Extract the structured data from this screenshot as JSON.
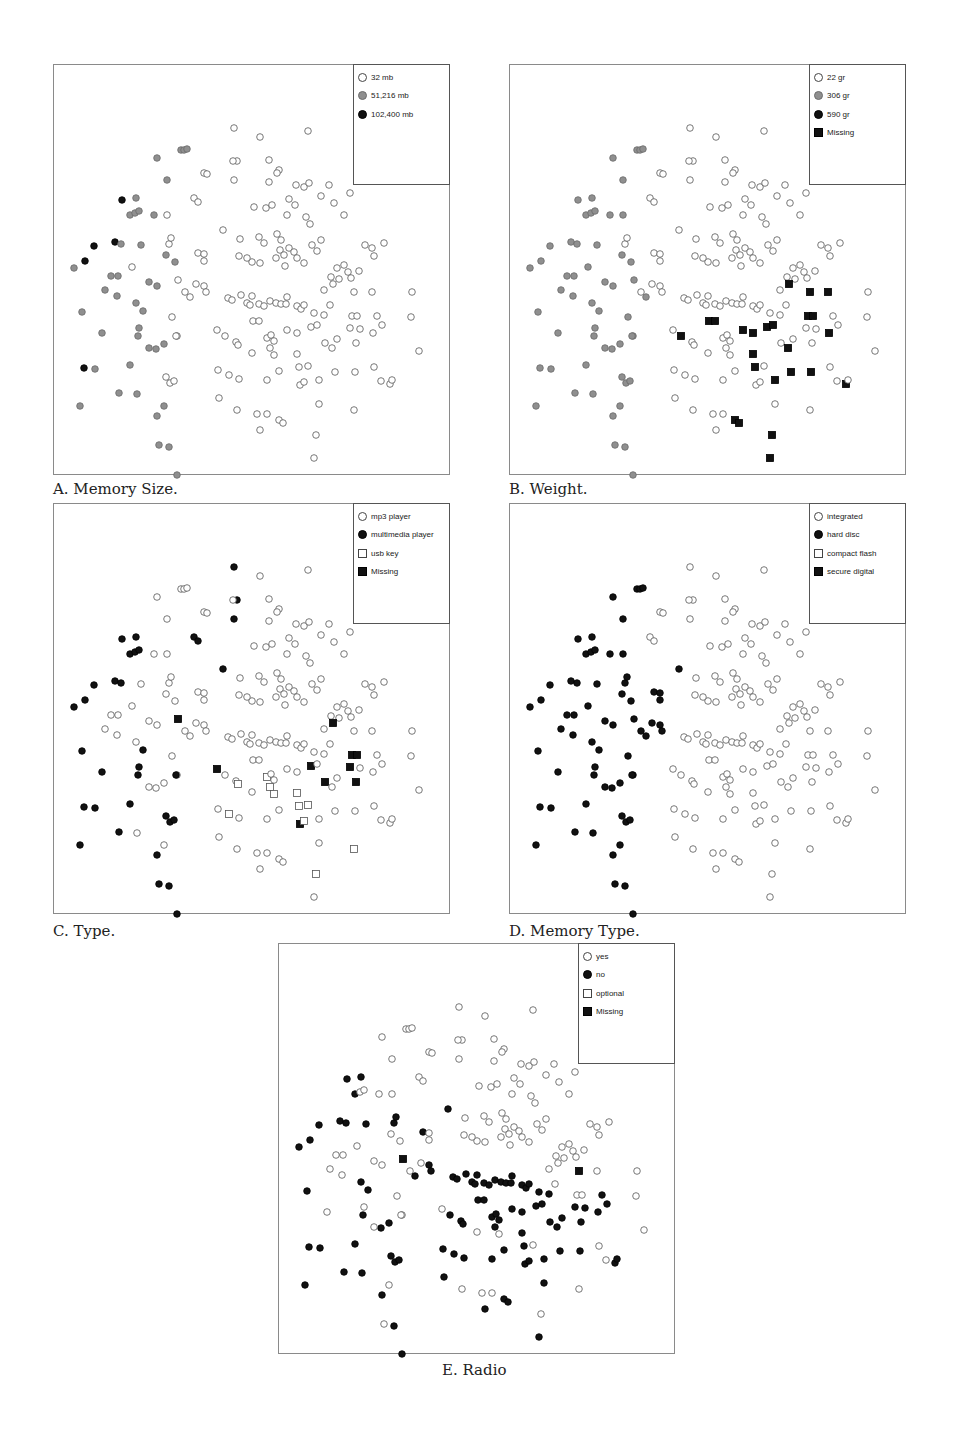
{
  "chart_data": [
    {
      "type": "scatter",
      "id": "A",
      "title": "A. Memory Size.",
      "xlabel": "",
      "ylabel": "",
      "grid": false,
      "legend_position": "top-right",
      "legend": [
        {
          "label": "32 mb",
          "marker": "circle",
          "fill": "hollow"
        },
        {
          "label": "51,216 mb",
          "marker": "circle",
          "fill": "gray"
        },
        {
          "label": "102,400 mb",
          "marker": "circle",
          "fill": "black"
        }
      ]
    },
    {
      "type": "scatter",
      "id": "B",
      "title": "B. Weight.",
      "xlabel": "",
      "ylabel": "",
      "grid": false,
      "legend_position": "top-right",
      "legend": [
        {
          "label": "22 gr",
          "marker": "circle",
          "fill": "hollow"
        },
        {
          "label": "306 gr",
          "marker": "circle",
          "fill": "gray"
        },
        {
          "label": "590 gr",
          "marker": "circle",
          "fill": "black"
        },
        {
          "label": "Missing",
          "marker": "square",
          "fill": "black"
        }
      ]
    },
    {
      "type": "scatter",
      "id": "C",
      "title": "C. Type.",
      "xlabel": "",
      "ylabel": "",
      "grid": false,
      "legend_position": "top-right",
      "legend": [
        {
          "label": "mp3 player",
          "marker": "circle",
          "fill": "hollow"
        },
        {
          "label": "multimedia player",
          "marker": "circle",
          "fill": "black"
        },
        {
          "label": "usb key",
          "marker": "square",
          "fill": "hollow"
        },
        {
          "label": "Missing",
          "marker": "square",
          "fill": "black"
        }
      ]
    },
    {
      "type": "scatter",
      "id": "D",
      "title": "D. Memory Type.",
      "xlabel": "",
      "ylabel": "",
      "grid": false,
      "legend_position": "top-right",
      "legend": [
        {
          "label": "integrated",
          "marker": "circle",
          "fill": "hollow"
        },
        {
          "label": "hard disc",
          "marker": "circle",
          "fill": "black"
        },
        {
          "label": "compact flash",
          "marker": "square",
          "fill": "hollow"
        },
        {
          "label": "secure digital",
          "marker": "square",
          "fill": "black"
        }
      ]
    },
    {
      "type": "scatter",
      "id": "E",
      "title": "E. Radio",
      "xlabel": "",
      "ylabel": "",
      "grid": false,
      "legend_position": "top-right",
      "legend": [
        {
          "label": "yes",
          "marker": "circle",
          "fill": "hollow"
        },
        {
          "label": "no",
          "marker": "circle",
          "fill": "black"
        },
        {
          "label": "optional",
          "marker": "square",
          "fill": "hollow"
        },
        {
          "label": "Missing",
          "marker": "square",
          "fill": "black"
        }
      ]
    }
  ],
  "points_note": "Shared 2D projection layout; coordinates in px relative to panel top-left (panel ~397x411). Each point lists category index for panels [A,B,C,D,E].",
  "points": [
    [
      180,
      63,
      0,
      0,
      1,
      0,
      0
    ],
    [
      206,
      72,
      0,
      0,
      0,
      0,
      0
    ],
    [
      254,
      66,
      0,
      0,
      0,
      0,
      0
    ],
    [
      127,
      85,
      1,
      1,
      0,
      1,
      0
    ],
    [
      130,
      85,
      1,
      1,
      0,
      1,
      0
    ],
    [
      133,
      84,
      1,
      1,
      0,
      1,
      0
    ],
    [
      103,
      93,
      1,
      1,
      0,
      1,
      0
    ],
    [
      183,
      96,
      0,
      0,
      1,
      0,
      0
    ],
    [
      179,
      96,
      0,
      0,
      0,
      0,
      0
    ],
    [
      150,
      108,
      0,
      0,
      0,
      0,
      0
    ],
    [
      153,
      109,
      0,
      0,
      0,
      0,
      0
    ],
    [
      180,
      115,
      0,
      0,
      1,
      0,
      0
    ],
    [
      215,
      95,
      0,
      0,
      0,
      0,
      0
    ],
    [
      225,
      105,
      0,
      0,
      0,
      0,
      0
    ],
    [
      113,
      115,
      1,
      1,
      0,
      1,
      0
    ],
    [
      68,
      135,
      2,
      1,
      1,
      1,
      1
    ],
    [
      82,
      133,
      1,
      1,
      1,
      1,
      1
    ],
    [
      76,
      150,
      1,
      1,
      1,
      1,
      1
    ],
    [
      81,
      148,
      1,
      1,
      1,
      1,
      0
    ],
    [
      85,
      146,
      1,
      1,
      1,
      1,
      0
    ],
    [
      100,
      150,
      1,
      1,
      0,
      1,
      0
    ],
    [
      113,
      150,
      0,
      1,
      0,
      1,
      0
    ],
    [
      140,
      133,
      0,
      0,
      1,
      0,
      0
    ],
    [
      144,
      137,
      0,
      0,
      1,
      0,
      0
    ],
    [
      215,
      117,
      0,
      0,
      0,
      0,
      0
    ],
    [
      223,
      108,
      0,
      0,
      0,
      0,
      0
    ],
    [
      242,
      120,
      0,
      0,
      0,
      0,
      0
    ],
    [
      250,
      122,
      0,
      0,
      0,
      0,
      0
    ],
    [
      255,
      118,
      0,
      0,
      0,
      0,
      0
    ],
    [
      275,
      120,
      0,
      0,
      0,
      0,
      0
    ],
    [
      235,
      134,
      0,
      0,
      0,
      0,
      0
    ],
    [
      241,
      140,
      0,
      0,
      0,
      0,
      0
    ],
    [
      267,
      131,
      0,
      0,
      0,
      0,
      0
    ],
    [
      296,
      128,
      0,
      0,
      0,
      0,
      0
    ],
    [
      280,
      138,
      0,
      0,
      0,
      0,
      0
    ],
    [
      290,
      150,
      0,
      0,
      0,
      0,
      0
    ],
    [
      200,
      142,
      0,
      0,
      0,
      0,
      0
    ],
    [
      212,
      143,
      0,
      0,
      0,
      0,
      0
    ],
    [
      218,
      140,
      0,
      0,
      0,
      0,
      0
    ],
    [
      233,
      150,
      0,
      0,
      0,
      0,
      0
    ],
    [
      252,
      152,
      0,
      0,
      0,
      0,
      0
    ],
    [
      256,
      159,
      0,
      0,
      0,
      0,
      0
    ],
    [
      61,
      177,
      2,
      1,
      1,
      1,
      1
    ],
    [
      67,
      179,
      1,
      1,
      1,
      1,
      1
    ],
    [
      40,
      181,
      2,
      1,
      1,
      1,
      1
    ],
    [
      87,
      180,
      1,
      1,
      0,
      1,
      1
    ],
    [
      115,
      179,
      0,
      0,
      0,
      1,
      1
    ],
    [
      117,
      173,
      0,
      0,
      0,
      1,
      1
    ],
    [
      169,
      165,
      0,
      0,
      1,
      1,
      1
    ],
    [
      186,
      174,
      0,
      0,
      0,
      0,
      0
    ],
    [
      205,
      172,
      0,
      0,
      0,
      0,
      0
    ],
    [
      210,
      178,
      0,
      0,
      0,
      0,
      0
    ],
    [
      223,
      169,
      0,
      0,
      0,
      0,
      0
    ],
    [
      227,
      175,
      0,
      0,
      0,
      0,
      0
    ],
    [
      226,
      185,
      0,
      0,
      0,
      0,
      0
    ],
    [
      235,
      183,
      0,
      0,
      0,
      0,
      0
    ],
    [
      240,
      187,
      0,
      0,
      0,
      0,
      0
    ],
    [
      222,
      193,
      0,
      0,
      0,
      0,
      0
    ],
    [
      230,
      190,
      0,
      0,
      0,
      0,
      0
    ],
    [
      243,
      193,
      0,
      0,
      0,
      0,
      0
    ],
    [
      231,
      201,
      0,
      0,
      0,
      0,
      0
    ],
    [
      206,
      198,
      0,
      0,
      0,
      0,
      0
    ],
    [
      198,
      197,
      0,
      0,
      0,
      0,
      0
    ],
    [
      185,
      191,
      0,
      0,
      0,
      0,
      0
    ],
    [
      193,
      193,
      0,
      0,
      0,
      0,
      0
    ],
    [
      258,
      180,
      0,
      0,
      0,
      0,
      0
    ],
    [
      267,
      175,
      0,
      0,
      0,
      0,
      0
    ],
    [
      263,
      186,
      0,
      0,
      0,
      0,
      0
    ],
    [
      250,
      198,
      0,
      0,
      0,
      0,
      0
    ],
    [
      20,
      203,
      1,
      1,
      1,
      1,
      1
    ],
    [
      31,
      196,
      2,
      1,
      1,
      1,
      1
    ],
    [
      78,
      202,
      0,
      1,
      0,
      1,
      0
    ],
    [
      112,
      190,
      1,
      1,
      0,
      1,
      0
    ],
    [
      121,
      197,
      1,
      1,
      0,
      1,
      0
    ],
    [
      144,
      188,
      0,
      0,
      0,
      1,
      1
    ],
    [
      150,
      189,
      0,
      0,
      0,
      1,
      0
    ],
    [
      150,
      196,
      0,
      0,
      0,
      1,
      0
    ],
    [
      283,
      203,
      0,
      0,
      0,
      0,
      0
    ],
    [
      290,
      200,
      0,
      0,
      0,
      0,
      0
    ],
    [
      294,
      207,
      0,
      0,
      0,
      0,
      0
    ],
    [
      277,
      212,
      0,
      0,
      0,
      0,
      0
    ],
    [
      285,
      214,
      0,
      0,
      0,
      0,
      0
    ],
    [
      297,
      213,
      0,
      0,
      0,
      0,
      0
    ],
    [
      305,
      206,
      0,
      0,
      0,
      0,
      0
    ],
    [
      318,
      183,
      0,
      0,
      0,
      0,
      0
    ],
    [
      311,
      180,
      0,
      0,
      0,
      0,
      0
    ],
    [
      320,
      191,
      0,
      0,
      0,
      0,
      0
    ],
    [
      330,
      178,
      0,
      0,
      0,
      0,
      0
    ],
    [
      57,
      211,
      1,
      1,
      0,
      1,
      0
    ],
    [
      64,
      211,
      1,
      1,
      0,
      1,
      0
    ],
    [
      51,
      225,
      1,
      1,
      0,
      1,
      0
    ],
    [
      63,
      231,
      1,
      1,
      0,
      1,
      0
    ],
    [
      95,
      217,
      1,
      1,
      0,
      1,
      0
    ],
    [
      103,
      221,
      1,
      1,
      0,
      1,
      0
    ],
    [
      124,
      215,
      0,
      1,
      3,
      1,
      3
    ],
    [
      131,
      227,
      0,
      0,
      0,
      1,
      0
    ],
    [
      136,
      232,
      0,
      1,
      0,
      1,
      1
    ],
    [
      142,
      219,
      0,
      0,
      0,
      1,
      0
    ],
    [
      150,
      221,
      0,
      0,
      0,
      1,
      1
    ],
    [
      152,
      227,
      0,
      0,
      0,
      1,
      1
    ],
    [
      174,
      233,
      0,
      0,
      0,
      0,
      1
    ],
    [
      178,
      235,
      0,
      0,
      0,
      0,
      1
    ],
    [
      187,
      230,
      0,
      0,
      0,
      0,
      1
    ],
    [
      193,
      238,
      0,
      0,
      0,
      0,
      1
    ],
    [
      198,
      231,
      0,
      0,
      0,
      0,
      1
    ],
    [
      196,
      240,
      0,
      0,
      0,
      0,
      1
    ],
    [
      205,
      239,
      0,
      0,
      0,
      0,
      1
    ],
    [
      210,
      241,
      0,
      0,
      0,
      0,
      1
    ],
    [
      216,
      236,
      0,
      0,
      0,
      0,
      1
    ],
    [
      222,
      238,
      0,
      0,
      0,
      0,
      1
    ],
    [
      227,
      239,
      0,
      0,
      0,
      0,
      1
    ],
    [
      232,
      239,
      0,
      0,
      0,
      0,
      1
    ],
    [
      233,
      232,
      0,
      0,
      0,
      0,
      1
    ],
    [
      243,
      241,
      0,
      0,
      0,
      0,
      1
    ],
    [
      247,
      244,
      0,
      0,
      0,
      0,
      1
    ],
    [
      250,
      240,
      0,
      0,
      0,
      0,
      1
    ],
    [
      260,
      248,
      0,
      0,
      0,
      0,
      1
    ],
    [
      270,
      250,
      0,
      0,
      0,
      0,
      1
    ],
    [
      276,
      240,
      0,
      0,
      0,
      0,
      0
    ],
    [
      270,
      225,
      0,
      0,
      0,
      0,
      0
    ],
    [
      279,
      219,
      0,
      3,
      3,
      0,
      0
    ],
    [
      300,
      227,
      0,
      3,
      0,
      0,
      3
    ],
    [
      318,
      227,
      0,
      3,
      0,
      0,
      0
    ],
    [
      28,
      247,
      1,
      1,
      1,
      1,
      1
    ],
    [
      48,
      268,
      1,
      1,
      1,
      1,
      0
    ],
    [
      82,
      238,
      1,
      1,
      0,
      1,
      1
    ],
    [
      89,
      246,
      1,
      1,
      1,
      1,
      1
    ],
    [
      84,
      271,
      1,
      1,
      1,
      1,
      1
    ],
    [
      85,
      263,
      1,
      1,
      1,
      1,
      0
    ],
    [
      118,
      252,
      0,
      1,
      0,
      1,
      0
    ],
    [
      102,
      284,
      1,
      1,
      0,
      1,
      1
    ],
    [
      123,
      271,
      0,
      1,
      0,
      1,
      0
    ],
    [
      95,
      283,
      1,
      1,
      0,
      1,
      0
    ],
    [
      110,
      279,
      1,
      1,
      0,
      1,
      1
    ],
    [
      122,
      271,
      0,
      1,
      1,
      1,
      0
    ],
    [
      163,
      265,
      0,
      0,
      3,
      0,
      0
    ],
    [
      171,
      271,
      0,
      3,
      0,
      0,
      1
    ],
    [
      182,
      277,
      0,
      0,
      0,
      0,
      1
    ],
    [
      199,
      256,
      0,
      3,
      0,
      0,
      1
    ],
    [
      205,
      256,
      0,
      3,
      0,
      0,
      1
    ],
    [
      184,
      280,
      0,
      0,
      2,
      0,
      1
    ],
    [
      198,
      288,
      0,
      0,
      0,
      0,
      0
    ],
    [
      213,
      273,
      0,
      0,
      2,
      0,
      1
    ],
    [
      216,
      283,
      0,
      0,
      2,
      0,
      1
    ],
    [
      220,
      290,
      0,
      0,
      2,
      0,
      0
    ],
    [
      217,
      270,
      0,
      0,
      0,
      0,
      1
    ],
    [
      220,
      276,
      0,
      0,
      0,
      0,
      1
    ],
    [
      233,
      265,
      0,
      3,
      0,
      0,
      1
    ],
    [
      243,
      268,
      0,
      3,
      0,
      0,
      1
    ],
    [
      243,
      289,
      0,
      3,
      2,
      0,
      1
    ],
    [
      245,
      302,
      0,
      3,
      2,
      0,
      1
    ],
    [
      254,
      301,
      0,
      0,
      2,
      0,
      0
    ],
    [
      257,
      262,
      0,
      3,
      3,
      0,
      1
    ],
    [
      263,
      260,
      0,
      3,
      0,
      0,
      1
    ],
    [
      271,
      278,
      0,
      0,
      3,
      0,
      1
    ],
    [
      278,
      283,
      0,
      3,
      0,
      0,
      1
    ],
    [
      283,
      274,
      0,
      0,
      0,
      0,
      1
    ],
    [
      296,
      263,
      0,
      0,
      3,
      0,
      1
    ],
    [
      302,
      278,
      0,
      0,
      3,
      0,
      1
    ],
    [
      298,
      251,
      0,
      3,
      3,
      0,
      0
    ],
    [
      303,
      251,
      0,
      3,
      3,
      0,
      0
    ],
    [
      319,
      268,
      0,
      3,
      0,
      0,
      1
    ],
    [
      323,
      251,
      0,
      0,
      0,
      0,
      1
    ],
    [
      328,
      260,
      0,
      0,
      0,
      0,
      1
    ],
    [
      306,
      264,
      0,
      0,
      0,
      0,
      1
    ],
    [
      357,
      252,
      0,
      0,
      0,
      0,
      0
    ],
    [
      365,
      286,
      0,
      0,
      0,
      0,
      0
    ],
    [
      358,
      227,
      0,
      0,
      0,
      0,
      0
    ],
    [
      30,
      303,
      2,
      1,
      1,
      1,
      1
    ],
    [
      41,
      304,
      1,
      1,
      1,
      1,
      1
    ],
    [
      76,
      300,
      1,
      1,
      1,
      1,
      1
    ],
    [
      112,
      312,
      0,
      1,
      1,
      1,
      1
    ],
    [
      116,
      318,
      0,
      1,
      1,
      1,
      1
    ],
    [
      120,
      316,
      0,
      1,
      1,
      1,
      1
    ],
    [
      65,
      328,
      1,
      1,
      1,
      1,
      1
    ],
    [
      83,
      329,
      1,
      1,
      0,
      1,
      1
    ],
    [
      164,
      305,
      0,
      0,
      0,
      0,
      1
    ],
    [
      175,
      310,
      0,
      0,
      2,
      0,
      1
    ],
    [
      185,
      314,
      0,
      0,
      0,
      0,
      1
    ],
    [
      213,
      315,
      0,
      0,
      0,
      0,
      1
    ],
    [
      225,
      306,
      0,
      0,
      0,
      0,
      1
    ],
    [
      246,
      320,
      0,
      0,
      3,
      0,
      1
    ],
    [
      250,
      317,
      0,
      0,
      2,
      0,
      1
    ],
    [
      265,
      315,
      0,
      3,
      0,
      0,
      1
    ],
    [
      281,
      307,
      0,
      3,
      0,
      0,
      1
    ],
    [
      301,
      307,
      0,
      3,
      0,
      0,
      1
    ],
    [
      320,
      302,
      0,
      0,
      0,
      0,
      0
    ],
    [
      327,
      316,
      0,
      0,
      0,
      0,
      0
    ],
    [
      336,
      319,
      0,
      3,
      0,
      0,
      1
    ],
    [
      338,
      315,
      0,
      0,
      0,
      0,
      1
    ],
    [
      26,
      341,
      1,
      1,
      1,
      1,
      1
    ],
    [
      110,
      341,
      1,
      1,
      0,
      1,
      0
    ],
    [
      165,
      333,
      0,
      0,
      0,
      0,
      1
    ],
    [
      183,
      345,
      0,
      0,
      0,
      0,
      0
    ],
    [
      203,
      349,
      0,
      0,
      0,
      0,
      0
    ],
    [
      213,
      349,
      0,
      0,
      0,
      0,
      0
    ],
    [
      225,
      355,
      0,
      3,
      0,
      0,
      1
    ],
    [
      229,
      358,
      0,
      3,
      0,
      0,
      1
    ],
    [
      206,
      365,
      0,
      0,
      0,
      0,
      1
    ],
    [
      265,
      339,
      0,
      0,
      0,
      0,
      1
    ],
    [
      300,
      345,
      0,
      0,
      2,
      0,
      0
    ],
    [
      103,
      351,
      1,
      1,
      1,
      1,
      1
    ],
    [
      115,
      382,
      1,
      1,
      1,
      1,
      1
    ],
    [
      262,
      370,
      0,
      3,
      2,
      0,
      0
    ],
    [
      105,
      380,
      1,
      1,
      1,
      1,
      0
    ],
    [
      260,
      393,
      0,
      3,
      0,
      0,
      1
    ],
    [
      123,
      410,
      1,
      1,
      1,
      1,
      1
    ]
  ]
}
